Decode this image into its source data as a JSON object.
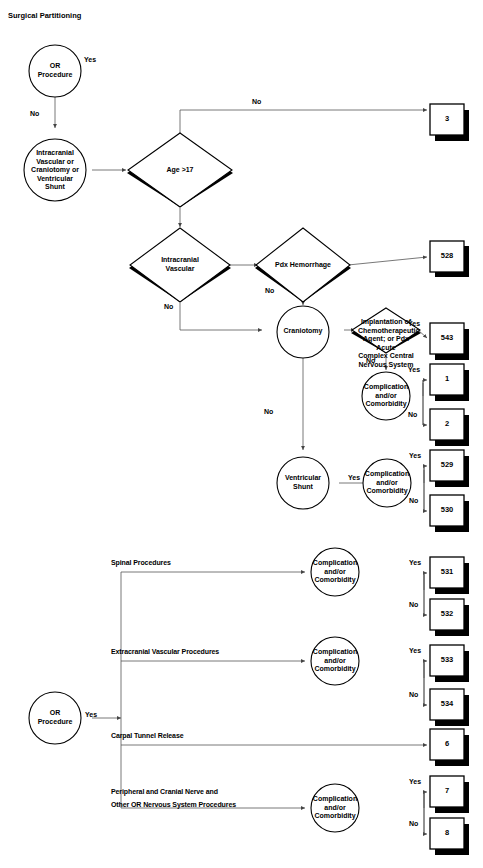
{
  "diagram": {
    "title": "Surgical Partitioning",
    "type": "decision-flowchart",
    "nodes": {
      "or_procedure_top": "OR\nProcedure",
      "intracranial_group": "Intracranial\nVascular or\nCraniotomy or\nVentricular\nShunt",
      "age_gt_17": "Age >17",
      "intracranial_vascular": "Intracranial\nVascular",
      "pdx_hemorrhage": "Pdx Hemorrhage",
      "craniotomy": "Craniotomy",
      "implantation": "Implantation of\nChemotherapeutic\nAgent; or Pdx Acute\nComplex Central\nNervous System",
      "complication_1": "Complication\nand/or\nComorbidity",
      "ventricular_shunt": "Ventricular\nShunt",
      "complication_2": "Complication\nand/or\nComorbidity",
      "complication_3": "Complication\nand/or\nComorbidity",
      "complication_4": "Complication\nand/or\nComorbidity",
      "complication_5": "Complication\nand/or\nComorbidity",
      "or_procedure_bottom": "OR\nProcedure",
      "spinal_procedures": "Spinal Procedures",
      "extracranial_vascular": "Extracranial Vascular Procedures",
      "carpal_tunnel": "Carpal Tunnel Release",
      "peripheral_nerve_line1": "Peripheral and Cranial Nerve and",
      "peripheral_nerve_line2": "Other OR Nervous System Procedures"
    },
    "terminals": {
      "t3": "3",
      "t528": "528",
      "t543": "543",
      "t1": "1",
      "t2": "2",
      "t529": "529",
      "t530": "530",
      "t531": "531",
      "t532": "532",
      "t533": "533",
      "t534": "534",
      "t6": "6",
      "t7": "7",
      "t8": "8"
    },
    "edge_labels": {
      "e_or_yes": "Yes",
      "e_or_no": "No",
      "e_age_no": "No",
      "e_iv_no": "No",
      "e_pdx_no": "No",
      "e_impl_yes": "Yes",
      "e_impl_no": "No",
      "e_c1_yes": "Yes",
      "e_c1_no": "No",
      "e_cranio_no": "No",
      "e_vs_yes": "Yes",
      "e_c2_yes": "Yes",
      "e_c2_no": "No",
      "e_c3_yes": "Yes",
      "e_c3_no": "No",
      "e_c4_yes": "Yes",
      "e_c4_no": "No",
      "e_orb_yes": "Yes",
      "e_c5_yes": "Yes",
      "e_c5_no": "No"
    },
    "colors": {
      "stroke": "#000000",
      "fill": "#ffffff",
      "shadow": "#000000",
      "line": "#555555",
      "background": "#ffffff"
    }
  }
}
